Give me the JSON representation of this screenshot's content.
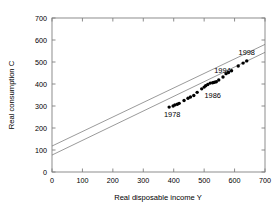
{
  "chart_data": {
    "type": "scatter",
    "title": "",
    "xlabel": "Real disposable income Y",
    "ylabel": "Real consumption C",
    "xlim": [
      0,
      700
    ],
    "ylim": [
      0,
      700
    ],
    "xticks": [
      0,
      100,
      200,
      300,
      400,
      500,
      600,
      700
    ],
    "yticks": [
      0,
      100,
      200,
      300,
      400,
      500,
      600,
      700
    ],
    "xtick_labels": [
      "0",
      "100",
      "200",
      "300",
      "400",
      "500",
      "600",
      "700"
    ],
    "ytick_labels": [
      "0",
      "100",
      "200",
      "300",
      "400",
      "500",
      "600",
      "700"
    ],
    "grid": false,
    "legend": "none",
    "marker": "filled-circle",
    "marker_color": "#000000",
    "line_color": "#6e6e6e",
    "frame_color": "#808080",
    "background": "#ffffff",
    "points": [
      {
        "x": 385,
        "y": 295
      },
      {
        "x": 398,
        "y": 300
      },
      {
        "x": 404,
        "y": 305
      },
      {
        "x": 412,
        "y": 308
      },
      {
        "x": 418,
        "y": 312
      },
      {
        "x": 434,
        "y": 325
      },
      {
        "x": 447,
        "y": 335
      },
      {
        "x": 455,
        "y": 341
      },
      {
        "x": 466,
        "y": 348
      },
      {
        "x": 477,
        "y": 362
      },
      {
        "x": 492,
        "y": 378
      },
      {
        "x": 500,
        "y": 386
      },
      {
        "x": 505,
        "y": 392
      },
      {
        "x": 512,
        "y": 398
      },
      {
        "x": 520,
        "y": 404
      },
      {
        "x": 528,
        "y": 406
      },
      {
        "x": 534,
        "y": 408
      },
      {
        "x": 540,
        "y": 410
      },
      {
        "x": 548,
        "y": 418
      },
      {
        "x": 562,
        "y": 432
      },
      {
        "x": 572,
        "y": 447
      },
      {
        "x": 580,
        "y": 452
      },
      {
        "x": 590,
        "y": 460
      },
      {
        "x": 612,
        "y": 482
      },
      {
        "x": 628,
        "y": 495
      },
      {
        "x": 640,
        "y": 505
      }
    ],
    "lines": [
      {
        "name": "upper-line",
        "intercept": 118,
        "slope": 0.66,
        "x_start": 0,
        "x_end": 700
      },
      {
        "name": "lower-line",
        "intercept": 77,
        "slope": 0.667,
        "x_start": 0,
        "x_end": 700
      }
    ],
    "annotations": [
      {
        "label": "1978",
        "x": 395,
        "y": 250,
        "point_x": 385,
        "point_y": 295
      },
      {
        "label": "1986",
        "x": 528,
        "y": 335,
        "point_x": 505,
        "point_y": 392
      },
      {
        "label": "1994",
        "x": 560,
        "y": 452,
        "point_x": 548,
        "point_y": 418
      },
      {
        "label": "1998",
        "x": 640,
        "y": 530,
        "point_x": 640,
        "point_y": 505
      }
    ]
  },
  "axes": {
    "x_title": "Real disposable income Y",
    "y_title": "Real consumption C"
  }
}
